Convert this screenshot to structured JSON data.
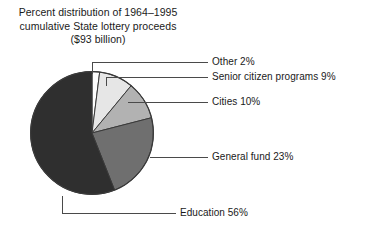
{
  "title": {
    "line1": "Percent distribution of 1964–1995",
    "line2": "cumulative State lottery proceeds",
    "line3": "($93 billion)"
  },
  "chart_data": {
    "type": "pie",
    "title": "Percent distribution of 1964–1995 cumulative State lottery proceeds ($93 billion)",
    "unit": "percent",
    "total_label": "$93 billion",
    "legend_position": "right-callouts",
    "grid": false,
    "start_angle_deg": 0,
    "direction": "clockwise",
    "categories": [
      "Other",
      "Senior citizen programs",
      "Cities",
      "General fund",
      "Education"
    ],
    "values": [
      2,
      9,
      10,
      23,
      56
    ],
    "labels": [
      "Other 2%",
      "Senior citizen programs 9%",
      "Cities 10%",
      "General fund 23%",
      "Education 56%"
    ],
    "colors": [
      "#fdfdfd",
      "#e6e6e6",
      "#b2b2b2",
      "#6f6f6f",
      "#2f2f2f"
    ],
    "slices": [
      {
        "name": "Other",
        "label": "Other 2%",
        "value": 2,
        "color": "#fdfdfd"
      },
      {
        "name": "Senior citizen programs",
        "label": "Senior citizen programs 9%",
        "value": 9,
        "color": "#e6e6e6"
      },
      {
        "name": "Cities",
        "label": "Cities 10%",
        "value": 10,
        "color": "#b2b2b2"
      },
      {
        "name": "General fund",
        "label": "General fund 23%",
        "value": 23,
        "color": "#6f6f6f"
      },
      {
        "name": "Education",
        "label": "Education 56%",
        "value": 56,
        "color": "#2f2f2f"
      }
    ]
  }
}
